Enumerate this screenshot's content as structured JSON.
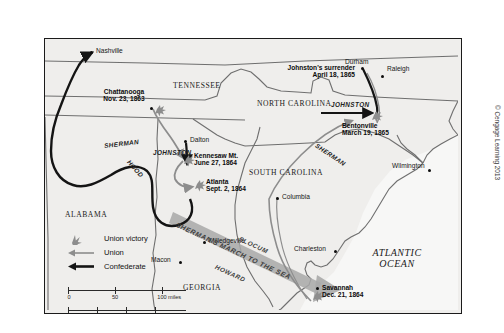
{
  "figure": {
    "copyright": "© Cengage Learning 2013"
  },
  "states": [
    {
      "name": "TENNESSEE",
      "x": 128,
      "y": 43
    },
    {
      "name": "NORTH CAROLINA",
      "x": 266,
      "y": 61
    },
    {
      "name": "SOUTH CAROLINA",
      "x": 246,
      "y": 130
    },
    {
      "name": "ALABAMA",
      "x": 20,
      "y": 172
    },
    {
      "name": "GEORGIA",
      "x": 148,
      "y": 245
    }
  ],
  "ocean": {
    "line1": "ATLANTIC",
    "line2": "OCEAN",
    "x": 322,
    "y": 215
  },
  "cities": [
    {
      "name": "Nashville",
      "x": 64,
      "y": 12,
      "side": "right"
    },
    {
      "name": "Dalton",
      "x": 143,
      "y": 103,
      "side": "right"
    },
    {
      "name": "Durham",
      "x": 330,
      "y": 22,
      "side": "left"
    },
    {
      "name": "Raleigh",
      "x": 359,
      "y": 31,
      "side": "right"
    },
    {
      "name": "Wilmington",
      "x": 382,
      "y": 125,
      "side": "left"
    },
    {
      "name": "Columbia",
      "x": 268,
      "y": 162,
      "side": "right"
    },
    {
      "name": "Charleston",
      "x": 300,
      "y": 213,
      "side": "left"
    },
    {
      "name": "Milledgeville",
      "x": 204,
      "y": 202,
      "side": "right"
    },
    {
      "name": "Macon",
      "x": 147,
      "y": 219,
      "side": "left"
    }
  ],
  "battles": [
    {
      "name": "Chattanooga",
      "date": "Nov. 23, 1863",
      "label_x": 76,
      "label_y": 55,
      "align": "center"
    },
    {
      "name": "Kennesaw Mt.",
      "date": "June 27, 1864",
      "label_x": 148,
      "label_y": 126,
      "align": "left"
    },
    {
      "name": "Atlanta",
      "date": "Sept. 2, 1864",
      "label_x": 163,
      "label_y": 152,
      "align": "left"
    },
    {
      "name": "Savannah",
      "date": "Dec. 21, 1864",
      "label_x": 277,
      "label_y": 252,
      "align": "left"
    },
    {
      "name": "Bentonville",
      "date": "March 19, 1865",
      "label_x": 303,
      "label_y": 88,
      "align": "left"
    }
  ],
  "annotations": [
    {
      "id": "johnston-surrender",
      "line1": "Johnston's surrender",
      "line2": "April 18, 1865",
      "x": 230,
      "y": 30
    }
  ],
  "army_labels": [
    {
      "name": "SHERMAN",
      "x": 59,
      "y": 104,
      "rotate": -7
    },
    {
      "name": "HOOD",
      "x": 78,
      "y": 128,
      "rotate": 48
    },
    {
      "name": "JOHNSTON",
      "x": 111,
      "y": 112,
      "rotate": 0
    },
    {
      "name": "JOHNSTON",
      "x": 300,
      "y": 65,
      "rotate": 0
    },
    {
      "name": "SHERMAN",
      "x": 277,
      "y": 118,
      "rotate": 34
    }
  ],
  "march": {
    "main": "SHERMAN'S MARCH TO THE SEA",
    "wing_north": "SLOCUM",
    "wing_south": "HOWARD"
  },
  "legend": {
    "items": [
      {
        "key": "union-victory-icon",
        "label": "Union victory"
      },
      {
        "key": "union-arrow-icon",
        "label": "Union"
      },
      {
        "key": "confederate-arrow-icon",
        "label": "Confederate"
      }
    ]
  },
  "scale": {
    "miles": {
      "ticks": [
        "0",
        "50",
        "100"
      ],
      "unit": "miles"
    },
    "kilometers": {
      "ticks": [
        "0",
        "50",
        "100",
        "150"
      ],
      "unit": "kilometers"
    }
  },
  "colors": {
    "union": "#8d8d8d",
    "confederate": "#141414",
    "land": "#efeeec",
    "border": "#6f6f6f",
    "march_arrow": "#a8a8a8"
  }
}
